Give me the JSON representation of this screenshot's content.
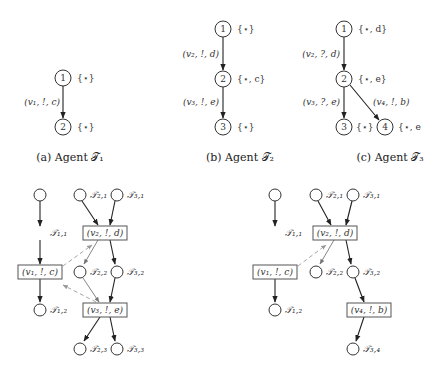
{
  "top": {
    "a": {
      "caption": "(a) Agent 𝒯₁",
      "nodes": [
        {
          "id": "1",
          "label": "{⋆}"
        },
        {
          "id": "2",
          "label": "{⋆}"
        }
      ],
      "edges": [
        {
          "from": "1",
          "to": "2",
          "label": "(v₁, !, c)"
        }
      ]
    },
    "b": {
      "caption": "(b) Agent 𝒯₂",
      "nodes": [
        {
          "id": "1",
          "label": "{⋆}"
        },
        {
          "id": "2",
          "label": "{⋆, c}"
        },
        {
          "id": "3",
          "label": "{⋆}"
        }
      ],
      "edges": [
        {
          "from": "1",
          "to": "2",
          "label": "(v₂, !, d)"
        },
        {
          "from": "2",
          "to": "3",
          "label": "(v₃, !, e)"
        }
      ]
    },
    "c": {
      "caption": "(c) Agent 𝒯₃",
      "nodes": [
        {
          "id": "1",
          "label": "{⋆, d}"
        },
        {
          "id": "2",
          "label": "{⋆, e}"
        },
        {
          "id": "3",
          "label": "{⋆}"
        },
        {
          "id": "4",
          "label": "{⋆, e"
        }
      ],
      "edges": [
        {
          "from": "1",
          "to": "2",
          "label": "(v₂, ?, d)"
        },
        {
          "from": "2",
          "to": "3",
          "label": "(v₃, ?, e)"
        },
        {
          "from": "2",
          "to": "4",
          "label": "(v₄, !, b)"
        }
      ]
    }
  },
  "bottom_left": {
    "places": {
      "t11": "𝒯₁,₁",
      "t12": "𝒯₁,₂",
      "t21": "𝒯₂,₁",
      "t22": "𝒯₂,₂",
      "t23": "𝒯₂,₃",
      "t31": "𝒯₃,₁",
      "t32": "𝒯₃,₂",
      "t33": "𝒯₃,₃"
    },
    "transitions": {
      "v1": "(v₁, !, c)",
      "v2": "(v₂, !, d)",
      "v3": "(v₃, !, e)"
    }
  },
  "bottom_right": {
    "places": {
      "t11": "𝒯₁,₁",
      "t12": "𝒯₁,₂",
      "t21": "𝒯₂,₁",
      "t22": "𝒯₂,₂",
      "t31": "𝒯₃,₁",
      "t32": "𝒯₃,₂",
      "t34": "𝒯₃,₄"
    },
    "transitions": {
      "v1": "(v₁, !, c)",
      "v2": "(v₂, !, d)",
      "v4": "(v₄, !, b)"
    }
  }
}
